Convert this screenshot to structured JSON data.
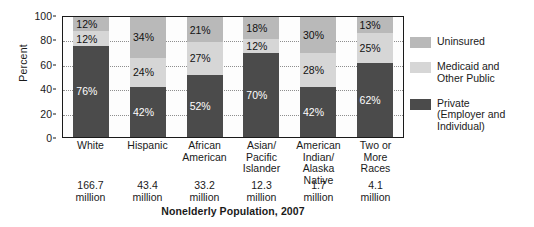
{
  "chart_data": {
    "type": "bar",
    "subtype": "stacked-bar-100",
    "title": "",
    "xlabel": "Nonelderly Population, 2007",
    "ylabel": "Percent",
    "ylim": [
      0,
      100
    ],
    "yticks": [
      0,
      20,
      40,
      60,
      80,
      100
    ],
    "ytick_labels": [
      "0",
      "20",
      "40",
      "60",
      "80",
      "100"
    ],
    "grid": true,
    "legend_position": "right",
    "categories": [
      "White",
      "Hispanic",
      "African\nAmerican",
      "Asian/\nPacific\nIslander",
      "American\nIndian/\nAlaska Native",
      "Two or\nMore\nRaces"
    ],
    "category_sublabels": [
      "166.7\nmillion",
      "43.4\nmillion",
      "33.2\nmillion",
      "12.3\nmillion",
      "1.7\nmillion",
      "4.1\nmillion"
    ],
    "series": [
      {
        "name": "Private (Employer and Individual)",
        "legend_label": "Private\n(Employer and\nIndividual)",
        "color": "#4b4b4b",
        "values": [
          76,
          42,
          52,
          70,
          42,
          62
        ],
        "value_labels": [
          "76%",
          "42%",
          "52%",
          "70%",
          "42%",
          "62%"
        ]
      },
      {
        "name": "Medicaid and Other Public",
        "legend_label": "Medicaid and\nOther Public",
        "color": "#d6d6d6",
        "values": [
          12,
          24,
          27,
          12,
          28,
          25
        ],
        "value_labels": [
          "12%",
          "24%",
          "27%",
          "12%",
          "28%",
          "25%"
        ]
      },
      {
        "name": "Uninsured",
        "legend_label": "Uninsured",
        "color": "#b9b9b9",
        "values": [
          12,
          34,
          21,
          18,
          30,
          13
        ],
        "value_labels": [
          "12%",
          "34%",
          "21%",
          "18%",
          "30%",
          "13%"
        ]
      }
    ]
  }
}
